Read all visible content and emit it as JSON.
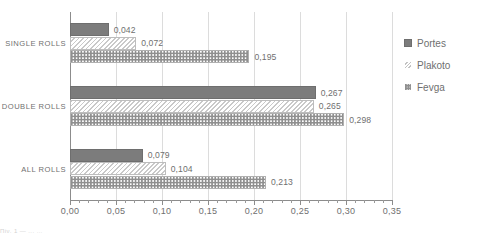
{
  "chart_data": {
    "type": "bar",
    "orientation": "horizontal",
    "title": "",
    "subtitle": "",
    "xlabel": "",
    "ylabel": "",
    "categories": [
      "SINGLE ROLLS",
      "DOUBLE ROLLS",
      "ALL ROLLS"
    ],
    "series": [
      {
        "name": "Portes",
        "values": [
          0.042,
          0.267,
          0.079
        ],
        "labels": [
          "0,042",
          "0,267",
          "0,079"
        ],
        "pattern": "solid-gray",
        "color": "#7c7c7c"
      },
      {
        "name": "Plakoto",
        "values": [
          0.072,
          0.265,
          0.104
        ],
        "labels": [
          "0,072",
          "0,265",
          "0,104"
        ],
        "pattern": "diagonal-hatch",
        "color": "#c9c9c9"
      },
      {
        "name": "Fevga",
        "values": [
          0.195,
          0.298,
          0.213
        ],
        "labels": [
          "0,195",
          "0,298",
          "0,213"
        ],
        "pattern": "checkerboard",
        "color": "#8f8f8f"
      }
    ],
    "xlim": [
      0.0,
      0.35
    ],
    "xticks": [
      0.0,
      0.05,
      0.1,
      0.15,
      0.2,
      0.25,
      0.3,
      0.35
    ],
    "xtick_labels": [
      "0,00",
      "0,05",
      "0,10",
      "0,15",
      "0,20",
      "0,25",
      "0,30",
      "0,35"
    ],
    "minor_tick_count_per_interval": 5,
    "grid": "vertical-major",
    "legend_position": "right",
    "data_labels": true,
    "decimal_separator": ","
  },
  "legend": {
    "items": [
      {
        "label": "Portes",
        "swatch": "portes-swatch-icon"
      },
      {
        "label": "Plakoto",
        "swatch": "plakoto-swatch-icon"
      },
      {
        "label": "Fevga",
        "swatch": "fevga-swatch-icon"
      }
    ]
  },
  "colors": {
    "portes": "#7c7c7c",
    "plakoto": "#c9c9c9",
    "fevga": "#8f8f8f",
    "gridline": "#dcdcdc",
    "axis": "#8c8c8c",
    "text": "#6f6f6f",
    "background": "#ffffff"
  },
  "artifacts": {
    "bottom_strip_text": "Πίν. 1  —  ...  …"
  }
}
